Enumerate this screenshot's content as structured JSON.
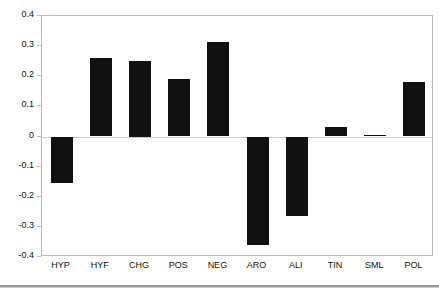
{
  "chart_data": {
    "type": "bar",
    "title": "",
    "subtitle": "",
    "xlabel": "",
    "ylabel": "",
    "categories": [
      "HYP",
      "HYF",
      "CHG",
      "POS",
      "NEG",
      "ARO",
      "ALI",
      "TIN",
      "SML",
      "POL"
    ],
    "values": [
      -0.155,
      0.26,
      0.25,
      0.19,
      0.315,
      -0.36,
      -0.265,
      0.03,
      0.005,
      0.18
    ],
    "series": [
      {
        "name": "",
        "values": [
          -0.155,
          0.26,
          0.25,
          0.19,
          0.315,
          -0.36,
          -0.265,
          0.03,
          0.005,
          0.18
        ]
      }
    ],
    "ylim": [
      -0.4,
      0.4
    ],
    "ytick_labels": [
      "0.4",
      "0.3",
      "0.2",
      "0.1",
      "0",
      "-0.1",
      "-0.2",
      "-0.3",
      "-0.4"
    ],
    "ytick_values": [
      0.4,
      0.3,
      0.2,
      0.1,
      0,
      -0.1,
      -0.2,
      -0.3,
      -0.4
    ],
    "grid": false,
    "legend": null,
    "legend_position": "none",
    "annotations": [],
    "bar_color": "#111111",
    "frame_color": "#b9b9b9",
    "zero_line_color": "#cfcfcf",
    "background_color": "#ffffff"
  }
}
